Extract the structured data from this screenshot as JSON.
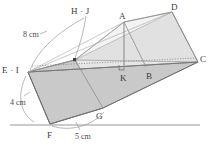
{
  "figure": {
    "background_color": "#ffffff",
    "stroke_color": "#6e6e6e",
    "faint_stroke_color": "#9a9a9a",
    "fill_front": "#c9c9c9",
    "fill_top": "#d6d6d6",
    "fill_side": "#bdbdbd",
    "baseline_color": "#8a8a8a",
    "label_color": "#3d3d3d"
  },
  "vertex_labels": [
    {
      "id": "HJ",
      "text": "H · J",
      "x": 71,
      "y": 7,
      "interactable": false
    },
    {
      "id": "A",
      "text": "A",
      "x": 119,
      "y": 12,
      "interactable": false
    },
    {
      "id": "D",
      "text": "D",
      "x": 171,
      "y": 3,
      "interactable": false
    },
    {
      "id": "C",
      "text": "C",
      "x": 200,
      "y": 55,
      "interactable": false
    },
    {
      "id": "EI",
      "text": "E · I",
      "x": 2,
      "y": 66,
      "interactable": false
    },
    {
      "id": "K",
      "text": "K",
      "x": 120,
      "y": 74,
      "interactable": false
    },
    {
      "id": "B",
      "text": "B",
      "x": 146,
      "y": 72,
      "interactable": false
    },
    {
      "id": "G",
      "text": "G",
      "x": 96,
      "y": 112,
      "interactable": false
    },
    {
      "id": "F",
      "text": "F",
      "x": 47,
      "y": 131,
      "interactable": false
    }
  ],
  "dimension_labels": [
    {
      "id": "edge-8cm",
      "text": "8 cm",
      "value": 8,
      "unit": "cm",
      "x": 23,
      "y": 31,
      "measures": "E·I to H·J (top edge)"
    },
    {
      "id": "edge-4cm",
      "text": "4 cm",
      "value": 4,
      "unit": "cm",
      "x": 10,
      "y": 99,
      "measures": "E·I to F (vertical edge)"
    },
    {
      "id": "edge-5cm",
      "text": "5 cm",
      "value": 5,
      "unit": "cm",
      "x": 75,
      "y": 133,
      "measures": "F to G (base edge)"
    }
  ],
  "annotations": {
    "right_angle_at": "K",
    "dotted_line": "E·I to C",
    "baseline": "horizontal ground line through F"
  }
}
